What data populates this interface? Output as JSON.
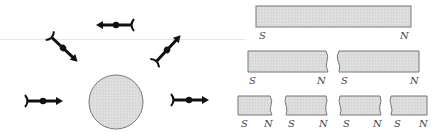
{
  "figure": {
    "left_panel": {
      "description": "Compass needles aligned around a spherical magnet",
      "magnet": {
        "shape": "circle",
        "fill": "#d9d9d9",
        "stroke": "#777777"
      },
      "compasses": [
        {
          "name": "top",
          "direction": "left"
        },
        {
          "name": "upper-left",
          "direction": "down-right"
        },
        {
          "name": "upper-right",
          "direction": "up-right"
        },
        {
          "name": "left",
          "direction": "right"
        },
        {
          "name": "right",
          "direction": "right"
        }
      ]
    },
    "right_panel": {
      "description": "Breaking a bar magnet yields smaller magnets each with S and N poles",
      "bar_fill": "#dcdcdc",
      "bar_stroke": "#777777",
      "rows": [
        {
          "magnets": [
            {
              "s": "S",
              "n": "N"
            }
          ]
        },
        {
          "magnets": [
            {
              "s": "S",
              "n": "N"
            },
            {
              "s": "S",
              "n": "N"
            }
          ]
        },
        {
          "magnets": [
            {
              "s": "S",
              "n": "N"
            },
            {
              "s": "S",
              "n": "N"
            },
            {
              "s": "S",
              "n": "N"
            },
            {
              "s": "S",
              "n": "N"
            }
          ]
        }
      ]
    }
  }
}
